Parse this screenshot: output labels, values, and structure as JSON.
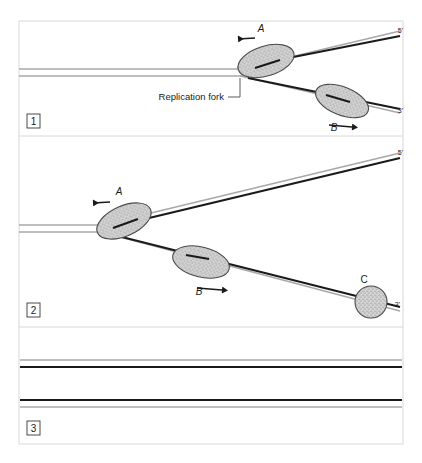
{
  "figure": {
    "border_color": "#d8d8d8",
    "background_color": "#ffffff",
    "template_strand_color": "#a8a8a8",
    "new_strand_color": "#1a1a1a",
    "enzyme_fill_color": "#cfcfcf",
    "enzyme_stroke_color": "#4a4a4a",
    "panel_divider_color": "#d8d8d8"
  },
  "panels": [
    {
      "badge": "1",
      "fork_label": "Replication fork",
      "end_labels": {
        "top": "5'",
        "bottom": "3'"
      },
      "enzymes": [
        {
          "id": "A",
          "label": "A",
          "shape": "ellipse",
          "direction": "left"
        },
        {
          "id": "B",
          "label": "B",
          "shape": "ellipse",
          "direction": "right"
        }
      ]
    },
    {
      "badge": "2",
      "end_labels": {
        "top": "5'",
        "bottom": "3'"
      },
      "enzymes": [
        {
          "id": "A",
          "label": "A",
          "shape": "ellipse",
          "direction": "left"
        },
        {
          "id": "B",
          "label": "B",
          "shape": "ellipse",
          "direction": "right"
        },
        {
          "id": "C",
          "label": "C",
          "shape": "circle",
          "direction": "none"
        }
      ]
    },
    {
      "badge": "3",
      "enzymes": [],
      "duplexes": [
        {
          "order": "top",
          "strands": [
            "template",
            "new"
          ]
        },
        {
          "order": "bottom",
          "strands": [
            "new",
            "template"
          ]
        }
      ]
    }
  ],
  "caption": {
    "text": ""
  }
}
